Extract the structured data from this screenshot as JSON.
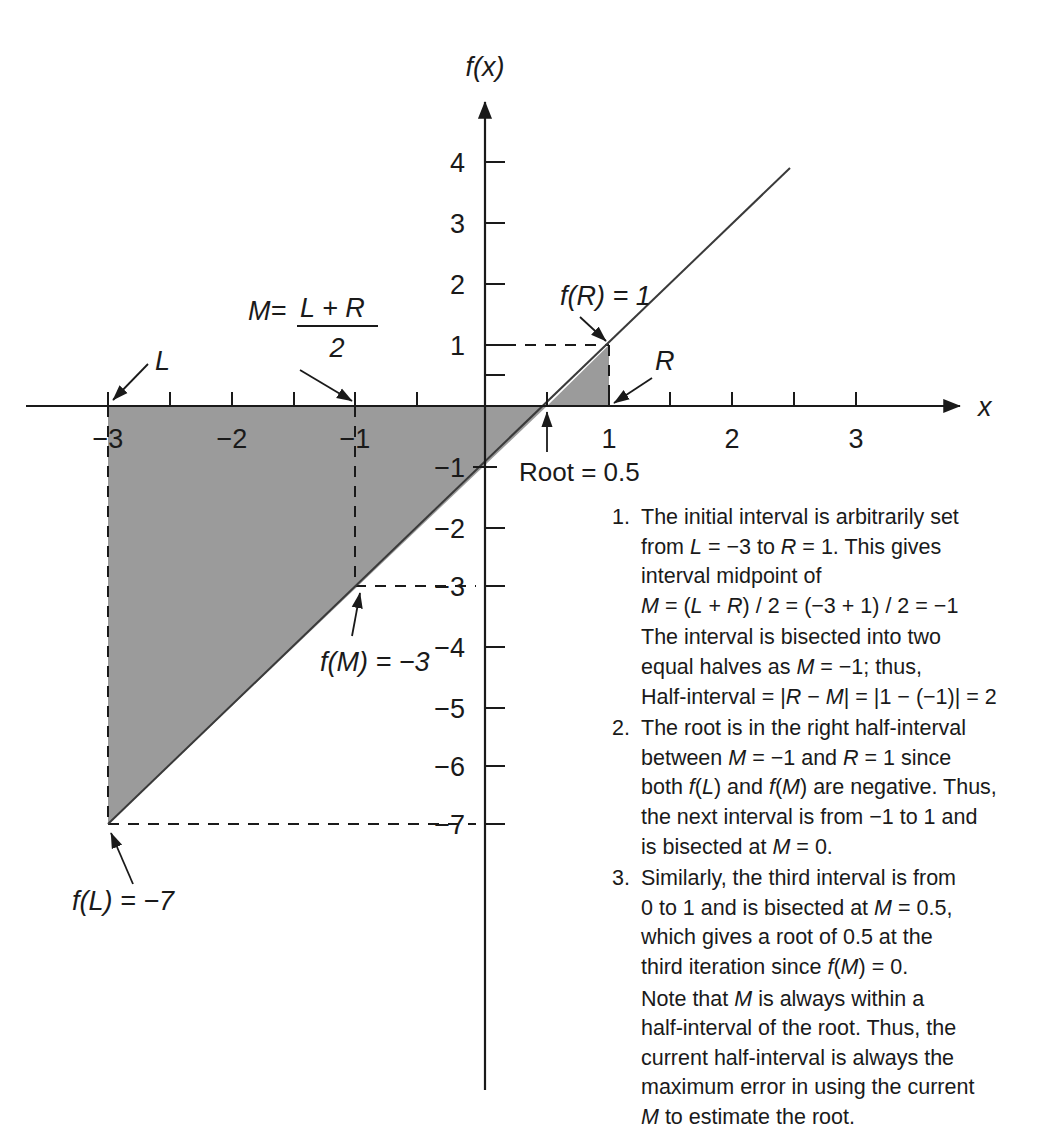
{
  "figure": {
    "axis": {
      "x_label": "x",
      "y_label": "f(x)",
      "x_ticks": [
        {
          "value": -3,
          "label": "−3"
        },
        {
          "value": -2.5,
          "label": ""
        },
        {
          "value": -2,
          "label": "−2"
        },
        {
          "value": -1.5,
          "label": ""
        },
        {
          "value": -1,
          "label": "−1"
        },
        {
          "value": -0.5,
          "label": ""
        },
        {
          "value": 0.5,
          "label": ""
        },
        {
          "value": 1,
          "label": "1"
        },
        {
          "value": 1.5,
          "label": ""
        },
        {
          "value": 2,
          "label": "2"
        },
        {
          "value": 2.5,
          "label": ""
        },
        {
          "value": 3,
          "label": "3"
        }
      ],
      "y_ticks": [
        {
          "value": 4,
          "label": "4"
        },
        {
          "value": 3,
          "label": "3"
        },
        {
          "value": 2,
          "label": "2"
        },
        {
          "value": 1,
          "label": "1"
        },
        {
          "value": 0.5,
          "label": ""
        },
        {
          "value": -1,
          "label": "−1"
        },
        {
          "value": -2,
          "label": "−2"
        },
        {
          "value": -3,
          "label": "−3"
        },
        {
          "value": -4,
          "label": "−4"
        },
        {
          "value": -5,
          "label": "−5"
        },
        {
          "value": -6,
          "label": "−6"
        },
        {
          "value": -7,
          "label": "−7"
        }
      ],
      "xlim": [
        -3.5,
        3.6
      ],
      "ylim": [
        -8.1,
        4.8
      ]
    },
    "annotations": {
      "L": "L",
      "R": "R",
      "M_formula_lhs": "M=",
      "M_formula_num": "L + R",
      "M_formula_den": "2",
      "f_of_R": "f(R) = 1",
      "f_of_M": "f(M) = −3",
      "f_of_L": "f(L) = −7",
      "root": "Root = 0.5"
    },
    "colors": {
      "fill": "#9b9b9b",
      "line": "#3a3a3a",
      "axis": "#1a1a1a",
      "background": "#ffffff"
    }
  },
  "chart_data": {
    "type": "line",
    "title": "",
    "xlabel": "x",
    "ylabel": "f(x)",
    "xlim": [
      -3.5,
      3.6
    ],
    "ylim": [
      -8.1,
      4.8
    ],
    "grid": false,
    "legend": "none",
    "series": [
      {
        "name": "f(x) = 2x - 1",
        "x": [
          -3.5,
          2.45
        ],
        "y": [
          -8,
          3.9
        ],
        "points_of_interest": [
          {
            "name": "L",
            "x": -3,
            "y": -7,
            "label": "f(L) = −7"
          },
          {
            "name": "M",
            "x": -1,
            "y": -3,
            "label": "f(M) = −3"
          },
          {
            "name": "Root",
            "x": 0.5,
            "y": 0,
            "label": "Root = 0.5"
          },
          {
            "name": "R",
            "x": 1,
            "y": 1,
            "label": "f(R) = 1"
          }
        ]
      }
    ],
    "shaded_region": {
      "description": "triangle-between-curve-and-x-axis",
      "vertices": [
        [
          -3,
          0
        ],
        [
          1,
          0
        ],
        [
          1,
          1
        ],
        [
          0.5,
          0
        ],
        [
          -3,
          -7
        ]
      ],
      "color": "#9b9b9b"
    },
    "dashed_guides": [
      {
        "from": [
          -3,
          0
        ],
        "to": [
          -3,
          -7
        ]
      },
      {
        "from": [
          -3,
          -7
        ],
        "to": [
          0,
          -7
        ]
      },
      {
        "from": [
          -1,
          0
        ],
        "to": [
          -1,
          -3
        ]
      },
      {
        "from": [
          -1,
          -3
        ],
        "to": [
          0,
          -3
        ]
      },
      {
        "from": [
          0,
          1
        ],
        "to": [
          1,
          1
        ]
      },
      {
        "from": [
          1,
          1
        ],
        "to": [
          1,
          0
        ]
      }
    ]
  },
  "notes": [
    {
      "number": "1.",
      "lines": [
        "The initial interval is arbitrarily set",
        "from <i>L</i> = −3 to <i>R</i> = 1. This gives",
        "interval midpoint of",
        "<i>M</i> = (<i>L</i> + <i>R</i>) / 2 = (−3 + 1) / 2 = −1"
      ],
      "extra_paragraph": [
        "The interval is bisected into two",
        "equal halves as <i>M</i> = −1; thus,",
        "Half-interval = |<i>R</i> − <i>M</i>| = |1 − (−1)| = 2"
      ]
    },
    {
      "number": "2.",
      "lines": [
        "The root is in the right half-interval",
        "between <i>M</i> = −1 and <i>R</i> = 1 since",
        "both <i>f</i>(<i>L</i>) and <i>f</i>(<i>M</i>) are negative. Thus,",
        "the next interval is from −1 to 1 and",
        "is bisected at <i>M</i> = 0."
      ],
      "extra_paragraph": []
    },
    {
      "number": "3.",
      "lines": [
        "Similarly, the third interval is from",
        "0 to 1 and is bisected at <i>M</i> = 0.5,",
        "which gives a root of 0.5 at the",
        "third iteration since <i>f</i>(<i>M</i>) = 0."
      ],
      "extra_paragraph": [
        "Note that <i>M</i> is always within a",
        "half-interval of the root. Thus, the",
        "current half-interval is always the",
        "maximum error in using the current",
        "<i>M</i> to estimate the root."
      ]
    }
  ]
}
